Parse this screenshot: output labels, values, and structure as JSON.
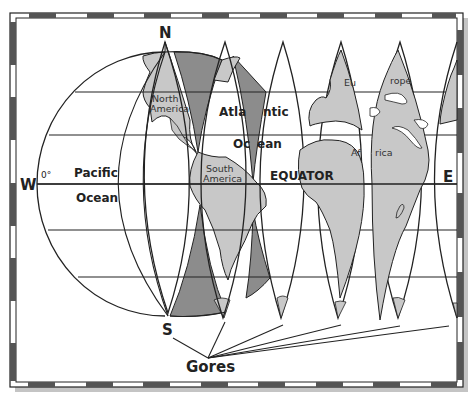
{
  "diagram": {
    "title": "Gores",
    "compass": {
      "north": "N",
      "south": "S",
      "west": "W",
      "east": "E"
    },
    "meridian_label": "0°",
    "line_label": "EQUATOR",
    "oceans": [
      {
        "id": "pacific",
        "lines": [
          "Pacific",
          "Ocean"
        ]
      },
      {
        "id": "atlantic",
        "lines": [
          "Atla",
          "ntic",
          "Oc",
          "ean"
        ]
      }
    ],
    "continents": [
      {
        "id": "north-america",
        "lines": [
          "North",
          "America"
        ]
      },
      {
        "id": "south-america",
        "lines": [
          "South",
          "America"
        ]
      },
      {
        "id": "europe",
        "lines": [
          "Eu",
          "rope"
        ]
      },
      {
        "id": "africa",
        "lines": [
          "Af",
          "rica"
        ]
      }
    ],
    "gore_pointer_label": "Gores",
    "colors": {
      "land": "#c8c8c8",
      "gore_shade": "#8c8c8c",
      "outline": "#222222",
      "border_dark": "#555555",
      "shadow": "#bdbdbd"
    }
  }
}
